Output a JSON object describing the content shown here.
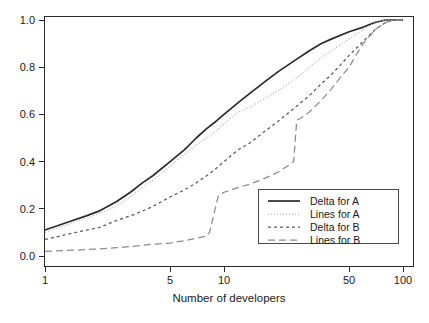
{
  "chart_data": {
    "type": "line",
    "title": "",
    "xlabel": "Number of developers",
    "ylabel": "",
    "xscale": "log",
    "xlim": [
      1,
      100
    ],
    "ylim": [
      0.0,
      1.0
    ],
    "grid": false,
    "legend_position": "bottom-right",
    "xticks": [
      1,
      5,
      10,
      50,
      100
    ],
    "xtick_labels": [
      "1",
      "5",
      "10",
      "50",
      "100"
    ],
    "yticks": [
      0.0,
      0.2,
      0.4,
      0.6,
      0.8,
      1.0
    ],
    "ytick_labels": [
      "0.0",
      "0.2",
      "0.4",
      "0.6",
      "0.8",
      "1.0"
    ],
    "series": [
      {
        "name": "Delta for A",
        "style": "solid",
        "color": "#2b2b2b",
        "x": [
          1,
          1.3,
          1.7,
          2,
          2.5,
          3,
          3.5,
          4,
          5,
          6,
          7,
          8,
          9,
          10,
          12,
          14,
          17,
          20,
          25,
          30,
          35,
          40,
          50,
          60,
          70,
          80,
          90,
          100
        ],
        "y": [
          0.11,
          0.14,
          0.17,
          0.19,
          0.23,
          0.27,
          0.31,
          0.34,
          0.4,
          0.45,
          0.5,
          0.54,
          0.57,
          0.6,
          0.65,
          0.69,
          0.74,
          0.78,
          0.83,
          0.87,
          0.9,
          0.92,
          0.95,
          0.97,
          0.99,
          1.0,
          1.0,
          1.0
        ]
      },
      {
        "name": "Lines for A",
        "style": "dotted",
        "color": "#b4b4b4",
        "x": [
          1,
          1.3,
          1.7,
          2,
          2.5,
          3,
          3.5,
          4,
          5,
          6,
          7,
          8,
          9,
          10,
          12,
          14,
          17,
          20,
          25,
          30,
          35,
          40,
          50,
          60,
          70,
          80,
          90,
          100
        ],
        "y": [
          0.1,
          0.13,
          0.16,
          0.18,
          0.21,
          0.25,
          0.29,
          0.32,
          0.38,
          0.43,
          0.47,
          0.5,
          0.53,
          0.56,
          0.61,
          0.63,
          0.67,
          0.7,
          0.75,
          0.8,
          0.84,
          0.87,
          0.92,
          0.96,
          0.99,
          1.0,
          1.0,
          1.0
        ]
      },
      {
        "name": "Delta for B",
        "style": "dashed-short",
        "color": "#5a5a5a",
        "x": [
          1,
          1.3,
          1.7,
          2,
          2.5,
          3,
          3.5,
          4,
          5,
          6,
          7,
          8,
          9,
          10,
          12,
          14,
          17,
          20,
          25,
          30,
          35,
          40,
          50,
          60,
          70,
          80,
          90,
          100
        ],
        "y": [
          0.07,
          0.09,
          0.11,
          0.12,
          0.15,
          0.17,
          0.19,
          0.21,
          0.25,
          0.28,
          0.31,
          0.34,
          0.37,
          0.4,
          0.45,
          0.48,
          0.53,
          0.57,
          0.63,
          0.68,
          0.73,
          0.77,
          0.85,
          0.91,
          0.96,
          0.99,
          1.0,
          1.0
        ]
      },
      {
        "name": "Lines for B",
        "style": "dashed-long",
        "color": "#8c8c8c",
        "x": [
          1,
          1.5,
          2,
          2.5,
          3,
          4,
          5,
          6,
          7,
          8,
          8.3,
          8.8,
          9.3,
          10,
          12,
          14,
          17,
          20,
          23,
          24.5,
          25.5,
          27,
          30,
          35,
          40,
          45,
          50,
          55,
          60,
          70,
          80,
          90,
          100
        ],
        "y": [
          0.02,
          0.025,
          0.03,
          0.035,
          0.04,
          0.05,
          0.055,
          0.065,
          0.075,
          0.085,
          0.1,
          0.18,
          0.255,
          0.27,
          0.29,
          0.305,
          0.33,
          0.355,
          0.385,
          0.4,
          0.575,
          0.585,
          0.61,
          0.66,
          0.71,
          0.76,
          0.8,
          0.855,
          0.9,
          0.96,
          0.99,
          1.0,
          1.0
        ]
      }
    ]
  },
  "legend": {
    "entries": [
      {
        "label": "Delta for A"
      },
      {
        "label": "Lines for A"
      },
      {
        "label": "Delta for B"
      },
      {
        "label": "Lines for B"
      }
    ]
  }
}
